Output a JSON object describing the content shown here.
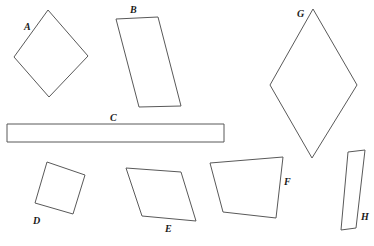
{
  "page": {
    "background_color": "#ffffff",
    "width": 374,
    "height": 246
  },
  "style": {
    "stroke_color": "#595959",
    "stroke_width": 1,
    "fill_color": "none",
    "label_color": "#1a1a1a",
    "label_font_size": 10
  },
  "shapes": [
    {
      "id": "shape-a",
      "label": "A",
      "kind": "square-rotated",
      "label_x": 24,
      "label_y": 30,
      "points": "48,10 88,56 49,97 14,57"
    },
    {
      "id": "shape-b",
      "label": "B",
      "kind": "parallelogram",
      "label_x": 130,
      "label_y": 13,
      "points": "116,19 158,17 181,106 139,107"
    },
    {
      "id": "shape-c",
      "label": "C",
      "kind": "rectangle-long",
      "label_x": 110,
      "label_y": 121,
      "points": "7,124 224,124 224,142 7,142"
    },
    {
      "id": "shape-d",
      "label": "D",
      "kind": "square-tilted",
      "label_x": 33,
      "label_y": 224,
      "points": "47,162 85,175 73,214 35,203"
    },
    {
      "id": "shape-e",
      "label": "E",
      "kind": "parallelogram",
      "label_x": 165,
      "label_y": 232,
      "points": "126,168 181,172 196,221 142,216"
    },
    {
      "id": "shape-f",
      "label": "F",
      "kind": "trapezoid",
      "label_x": 284,
      "label_y": 185,
      "points": "210,163 283,157 276,218 223,212"
    },
    {
      "id": "shape-g",
      "label": "G",
      "kind": "rhombus-tall",
      "label_x": 297,
      "label_y": 17,
      "points": "313,9 357,85 312,158 270,85"
    },
    {
      "id": "shape-h",
      "label": "H",
      "kind": "parallelogram-narrow",
      "label_x": 361,
      "label_y": 220,
      "points": "348,152 365,150 356,228 341,230"
    }
  ]
}
